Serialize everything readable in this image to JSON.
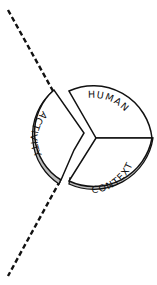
{
  "diagram": {
    "segments": [
      {
        "id": "activity",
        "label": "ACTIVITY"
      },
      {
        "id": "human",
        "label": "HUMAN"
      },
      {
        "id": "context",
        "label": "CONTEXT"
      }
    ],
    "colors": {
      "stroke": "#111111",
      "fill": "#ffffff",
      "shadow": "#bdbdbd"
    },
    "divider_line": "dashed"
  }
}
